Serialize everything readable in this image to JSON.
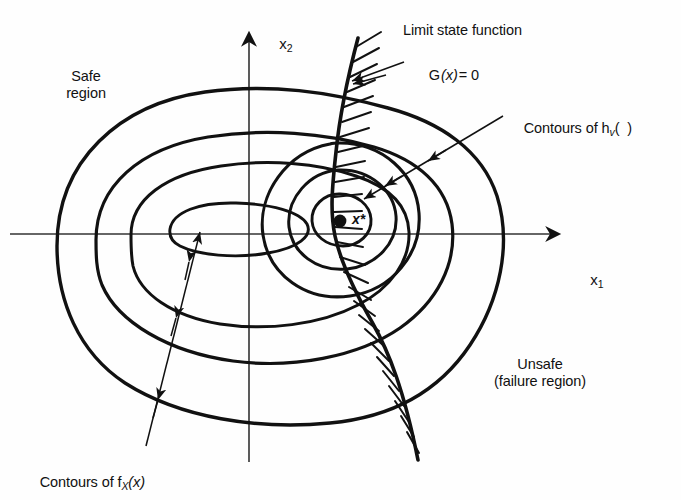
{
  "figure": {
    "type": "diagram",
    "title_axes": {
      "x_axis": "x",
      "x_axis_sub": "1",
      "y_axis": "x",
      "y_axis_sub": "2"
    },
    "labels": {
      "safe_region": "Safe\nregion",
      "unsafe_region": "Unsafe\n(failure region)",
      "limit_state_function": "Limit state function",
      "limit_state_equation_fn": "G",
      "limit_state_equation_arg": "(x)",
      "limit_state_equation_rhs": "= 0",
      "contours_hv_prefix": "Contours of h",
      "contours_hv_sub": "v",
      "contours_hv_suffix": "(  )",
      "contours_fx_prefix": "Contours of f",
      "contours_fx_sub": "X",
      "contours_fx_suffix": "(x)",
      "design_point": "x*"
    },
    "colors": {
      "ink": "#111111",
      "background": "#ffffff",
      "axis": "#333333"
    },
    "geometry": {
      "origin": {
        "x": 249,
        "y": 234
      },
      "design_point": {
        "x": 340,
        "y": 221
      },
      "x_axis_end": {
        "x": 566,
        "y": 234
      },
      "y_axis_top": {
        "x": 249,
        "y": 26
      },
      "fx_contour_count": 4,
      "hv_contour_count": 3,
      "hatch_side": "right"
    }
  }
}
